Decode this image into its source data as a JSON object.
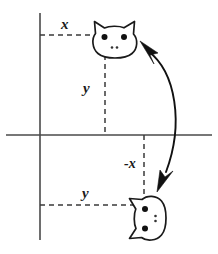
{
  "figure": {
    "background_color": "#ffffff",
    "ink_color": "#1a1a1a",
    "axis_color": "#4a4a4a"
  },
  "labels": {
    "x_top": "x",
    "y_upper": "y",
    "neg_x": "-x",
    "y_lower": "y"
  },
  "axes": {
    "x_axis": {
      "y": 135,
      "x_start": 6,
      "x_end": 212
    },
    "y_axis": {
      "x": 40,
      "y_start": 13,
      "y_end": 240
    }
  },
  "objects": [
    {
      "name": "cat-face-original",
      "position_label": "(x, y)",
      "quadrant": "I",
      "rotation_degrees": 0,
      "center_x": 115,
      "center_y": 40
    },
    {
      "name": "cat-face-rotated",
      "position_label": "(y, -x)",
      "quadrant": "IV",
      "rotation_degrees": -90,
      "center_x": 148,
      "center_y": 218
    }
  ],
  "guides": [
    {
      "name": "x-distance-guide",
      "orientation": "horizontal",
      "y": 35,
      "x_start": 40,
      "x_end": 100
    },
    {
      "name": "y-distance-guide-upper",
      "orientation": "vertical",
      "x": 105,
      "y_start": 57,
      "y_end": 135
    },
    {
      "name": "neg-x-distance-guide",
      "orientation": "vertical",
      "x": 144,
      "y_start": 135,
      "y_end": 205
    },
    {
      "name": "y-distance-guide-lower",
      "orientation": "horizontal",
      "y": 205,
      "x_start": 40,
      "x_end": 140
    }
  ],
  "arrow": {
    "name": "rotation-arrow",
    "style": "double-headed curved",
    "from": "cat-face-original",
    "to": "cat-face-rotated"
  }
}
